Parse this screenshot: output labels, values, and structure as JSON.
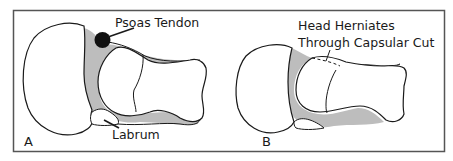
{
  "figure": {
    "panels": [
      {
        "id": "A",
        "letter": "A",
        "labels": {
          "psoas": "Psoas Tendon",
          "labrum": "Labrum"
        }
      },
      {
        "id": "B",
        "letter": "B",
        "labels": {
          "herniation_line1": "Head Herniates",
          "herniation_line2": "Through Capsular Cut"
        }
      }
    ],
    "colors": {
      "outline": "#1a1a1a",
      "capsule_fill": "#bdbdbd",
      "tendon_fill": "#111111",
      "frame": "#555555",
      "background": "#ffffff"
    }
  }
}
